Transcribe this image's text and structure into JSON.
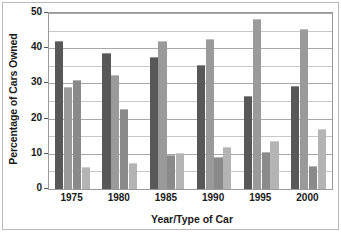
{
  "chart_data": {
    "type": "bar",
    "title": "",
    "xlabel": "Year/Type of Car",
    "ylabel": "Percentage of Cars Owned",
    "categories": [
      "1975",
      "1980",
      "1985",
      "1990",
      "1995",
      "2000"
    ],
    "ylim": [
      0,
      50
    ],
    "ytick_labels": [
      "0",
      "10",
      "20",
      "30",
      "40",
      "50"
    ],
    "ytick_values": [
      0,
      10,
      20,
      30,
      40,
      50
    ],
    "minor_gridlines": [
      5,
      15,
      25,
      35,
      45
    ],
    "grid": true,
    "legend": "none",
    "series": [
      {
        "name": "Series 1",
        "color": "#585858",
        "values": [
          42,
          38.7,
          37.4,
          35.3,
          26.4,
          29.4
        ]
      },
      {
        "name": "Series 2",
        "color": "#9a9a9a",
        "values": [
          29,
          32.4,
          42,
          42.7,
          48.2,
          45.6
        ]
      },
      {
        "name": "Series 3",
        "color": "#8a8a8a",
        "values": [
          31,
          22.6,
          9.6,
          9.2,
          10.6,
          6.5
        ]
      },
      {
        "name": "Series 4",
        "color": "#b4b4b4",
        "values": [
          6.2,
          7.3,
          10.3,
          11.9,
          13.5,
          17
        ]
      }
    ]
  }
}
